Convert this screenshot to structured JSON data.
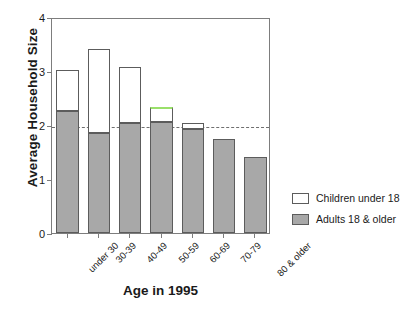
{
  "chart_data": {
    "type": "bar",
    "subtype": "stacked-bar",
    "title": "",
    "xlabel": "Age in 1995",
    "ylabel": "Average Household Size",
    "categories": [
      "under 30",
      "30-39",
      "40-49",
      "50-59",
      "60-69",
      "70-79",
      "80 & older"
    ],
    "ylim": [
      0,
      4
    ],
    "yticks": [
      0,
      1,
      2,
      3,
      4
    ],
    "ytick_labels": [
      "0",
      "1",
      "2",
      "3",
      "4"
    ],
    "grid": false,
    "legend_position": "right",
    "series": [
      {
        "name": "Adults 18 & older",
        "color": "#a8a8a8",
        "values": [
          2.26,
          1.85,
          2.04,
          2.06,
          1.93,
          1.74,
          1.41
        ]
      },
      {
        "name": "Children under 18",
        "color": "#ffffff",
        "values": [
          0.75,
          1.56,
          1.03,
          0.27,
          0.11,
          0.0,
          0.0
        ]
      }
    ],
    "totals": [
      3.01,
      3.41,
      3.07,
      2.33,
      2.04,
      1.74,
      1.41
    ],
    "annotations": [
      {
        "type": "reference-line",
        "axis": "y",
        "value": 2,
        "style": "dashed",
        "color": "#6f6f6f"
      },
      {
        "type": "highlight",
        "target_category": "50-59",
        "description": "green top edge on stacked bar",
        "color": "#9ae06a"
      }
    ]
  },
  "legend": {
    "items": [
      {
        "label": "Children under 18",
        "swatch": "white"
      },
      {
        "label": "Adults 18 & older",
        "swatch": "gray"
      }
    ]
  },
  "colors": {
    "adults_fill": "#a8a8a8",
    "children_fill": "#ffffff",
    "outline": "#5c5c5c",
    "frame": "#7d7d7d",
    "refline": "#6f6f6f",
    "highlight": "#9ae06a"
  }
}
